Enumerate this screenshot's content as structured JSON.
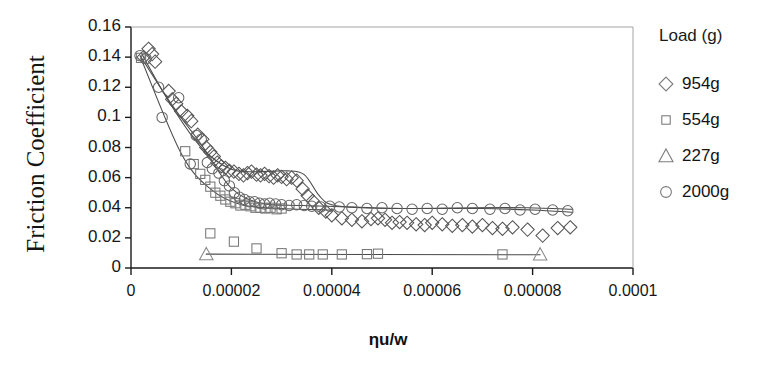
{
  "chart_data": {
    "type": "scatter",
    "title": "",
    "xlabel": "ηu/w",
    "ylabel": "Friction Coefficient",
    "xlim": [
      0,
      0.0001
    ],
    "ylim": [
      0,
      0.16
    ],
    "grid": false,
    "legend_position": "right",
    "legend_title": "Load (g)",
    "x_ticks": [
      "0",
      "0.00002",
      "0.00004",
      "0.00006",
      "0.00008",
      "0.0001"
    ],
    "x_tick_values": [
      0,
      2e-05,
      4e-05,
      6e-05,
      8e-05,
      0.0001
    ],
    "y_ticks": [
      "0",
      "0.02",
      "0.04",
      "0.06",
      "0.08",
      "0.1",
      "0.12",
      "0.14",
      "0.16"
    ],
    "y_tick_values": [
      0,
      0.02,
      0.04,
      0.06,
      0.08,
      0.1,
      0.12,
      0.14,
      0.16
    ],
    "series": [
      {
        "name": "954g",
        "marker": "diamond",
        "color": "#555555",
        "points": [
          [
            2.5e-06,
            0.14
          ],
          [
            3.5e-06,
            0.1455
          ],
          [
            4.2e-06,
            0.142
          ],
          [
            4.8e-06,
            0.137
          ],
          [
            7.5e-06,
            0.1175
          ],
          [
            8.2e-06,
            0.112
          ],
          [
            9e-06,
            0.109
          ],
          [
            1e-05,
            0.104
          ],
          [
            1.12e-05,
            0.101
          ],
          [
            1.2e-05,
            0.0975
          ],
          [
            1.33e-05,
            0.0885
          ],
          [
            1.42e-05,
            0.0855
          ],
          [
            1.5e-05,
            0.08
          ],
          [
            1.58e-05,
            0.077
          ],
          [
            1.65e-05,
            0.074
          ],
          [
            1.72e-05,
            0.07
          ],
          [
            1.8e-05,
            0.0675
          ],
          [
            1.88e-05,
            0.0665
          ],
          [
            1.96e-05,
            0.0645
          ],
          [
            2.05e-05,
            0.064
          ],
          [
            2.15e-05,
            0.0625
          ],
          [
            2.24e-05,
            0.0615
          ],
          [
            2.32e-05,
            0.063
          ],
          [
            2.4e-05,
            0.064
          ],
          [
            2.5e-05,
            0.062
          ],
          [
            2.58e-05,
            0.0615
          ],
          [
            2.66e-05,
            0.0625
          ],
          [
            2.75e-05,
            0.061
          ],
          [
            2.84e-05,
            0.06
          ],
          [
            2.92e-05,
            0.0615
          ],
          [
            3e-05,
            0.0605
          ],
          [
            3.1e-05,
            0.059
          ],
          [
            3.2e-05,
            0.06
          ],
          [
            3.3e-05,
            0.058
          ],
          [
            3.42e-05,
            0.0525
          ],
          [
            3.52e-05,
            0.048
          ],
          [
            3.62e-05,
            0.0445
          ],
          [
            3.74e-05,
            0.04
          ],
          [
            3.88e-05,
            0.0375
          ],
          [
            4e-05,
            0.035
          ],
          [
            4.2e-05,
            0.033
          ],
          [
            4.4e-05,
            0.032
          ],
          [
            4.6e-05,
            0.031
          ],
          [
            4.78e-05,
            0.0325
          ],
          [
            4.92e-05,
            0.033
          ],
          [
            5.06e-05,
            0.032
          ],
          [
            5.2e-05,
            0.03
          ],
          [
            5.35e-05,
            0.0305
          ],
          [
            5.5e-05,
            0.03
          ],
          [
            5.68e-05,
            0.029
          ],
          [
            5.85e-05,
            0.0285
          ],
          [
            6e-05,
            0.03
          ],
          [
            6.2e-05,
            0.029
          ],
          [
            6.4e-05,
            0.028
          ],
          [
            6.6e-05,
            0.0285
          ],
          [
            6.8e-05,
            0.0275
          ],
          [
            7e-05,
            0.0285
          ],
          [
            7.2e-05,
            0.0265
          ],
          [
            7.4e-05,
            0.026
          ],
          [
            7.6e-05,
            0.027
          ],
          [
            7.9e-05,
            0.0255
          ],
          [
            8.2e-05,
            0.0215
          ],
          [
            8.5e-05,
            0.0265
          ],
          [
            8.75e-05,
            0.027
          ]
        ],
        "trend": [
          [
            2e-06,
            0.143
          ],
          [
            8e-06,
            0.108
          ],
          [
            1.4e-05,
            0.08
          ],
          [
            2e-05,
            0.0655
          ],
          [
            2.6e-05,
            0.064
          ],
          [
            3.1e-05,
            0.0645
          ],
          [
            3.45e-05,
            0.062
          ],
          [
            3.75e-05,
            0.048
          ],
          [
            4e-05,
            0.042
          ],
          [
            4.6e-05,
            0.04
          ],
          [
            5.6e-05,
            0.0395
          ],
          [
            6.8e-05,
            0.04
          ],
          [
            7.9e-05,
            0.04
          ],
          [
            8.8e-05,
            0.039
          ]
        ]
      },
      {
        "name": "554g",
        "marker": "square",
        "color": "#777777",
        "points": [
          [
            2e-06,
            0.1395
          ],
          [
            1.08e-05,
            0.0775
          ],
          [
            1.25e-05,
            0.069
          ],
          [
            1.38e-05,
            0.0625
          ],
          [
            1.48e-05,
            0.0585
          ],
          [
            1.58e-05,
            0.054
          ],
          [
            1.68e-05,
            0.05
          ],
          [
            1.78e-05,
            0.048
          ],
          [
            1.88e-05,
            0.0455
          ],
          [
            1.98e-05,
            0.044
          ],
          [
            2.08e-05,
            0.043
          ],
          [
            2.18e-05,
            0.0415
          ],
          [
            2.28e-05,
            0.042
          ],
          [
            2.38e-05,
            0.041
          ],
          [
            2.48e-05,
            0.04
          ],
          [
            2.58e-05,
            0.04
          ],
          [
            2.68e-05,
            0.0395
          ],
          [
            2.78e-05,
            0.04
          ],
          [
            2.9e-05,
            0.039
          ],
          [
            3e-05,
            0.0395
          ],
          [
            1.58e-05,
            0.023
          ],
          [
            2.05e-05,
            0.0175
          ],
          [
            2.5e-05,
            0.013
          ],
          [
            3e-05,
            0.0098
          ],
          [
            3.3e-05,
            0.009
          ],
          [
            3.55e-05,
            0.009
          ],
          [
            3.82e-05,
            0.009
          ],
          [
            4.2e-05,
            0.009
          ],
          [
            4.7e-05,
            0.0092
          ],
          [
            4.92e-05,
            0.0095
          ],
          [
            7.4e-05,
            0.009
          ]
        ],
        "trend": [
          [
            2e-06,
            0.139
          ],
          [
            1e-05,
            0.076
          ],
          [
            1.6e-05,
            0.052
          ],
          [
            2.2e-05,
            0.042
          ],
          [
            3e-05,
            0.0395
          ],
          [
            4e-05,
            0.0385
          ]
        ]
      },
      {
        "name": "227g",
        "marker": "triangle",
        "color": "#888888",
        "points": [
          [
            1.5e-05,
            0.0092
          ],
          [
            8.15e-05,
            0.009
          ]
        ],
        "trend": [
          [
            1.5e-05,
            0.0092
          ],
          [
            8.15e-05,
            0.0088
          ]
        ]
      },
      {
        "name": "2000g",
        "marker": "circle",
        "color": "#666666",
        "points": [
          [
            1.8e-06,
            0.141
          ],
          [
            3e-06,
            0.139
          ],
          [
            5.5e-06,
            0.12
          ],
          [
            6.2e-06,
            0.1
          ],
          [
            9.5e-06,
            0.113
          ],
          [
            1.3e-05,
            0.088
          ],
          [
            1.4e-05,
            0.0855
          ],
          [
            1.18e-05,
            0.069
          ],
          [
            1.52e-05,
            0.07
          ],
          [
            1.62e-05,
            0.066
          ],
          [
            1.75e-05,
            0.063
          ],
          [
            1.86e-05,
            0.058
          ],
          [
            1.96e-05,
            0.0545
          ],
          [
            2.06e-05,
            0.05
          ],
          [
            2.16e-05,
            0.047
          ],
          [
            2.26e-05,
            0.0455
          ],
          [
            2.36e-05,
            0.044
          ],
          [
            2.46e-05,
            0.044
          ],
          [
            2.56e-05,
            0.043
          ],
          [
            2.66e-05,
            0.0425
          ],
          [
            2.76e-05,
            0.043
          ],
          [
            2.88e-05,
            0.0425
          ],
          [
            3e-05,
            0.042
          ],
          [
            3.15e-05,
            0.0415
          ],
          [
            3.3e-05,
            0.042
          ],
          [
            3.45e-05,
            0.0415
          ],
          [
            3.6e-05,
            0.041
          ],
          [
            3.78e-05,
            0.0405
          ],
          [
            3.96e-05,
            0.041
          ],
          [
            4.15e-05,
            0.0405
          ],
          [
            4.4e-05,
            0.04
          ],
          [
            4.7e-05,
            0.0395
          ],
          [
            5e-05,
            0.04
          ],
          [
            5.3e-05,
            0.0395
          ],
          [
            5.6e-05,
            0.039
          ],
          [
            5.9e-05,
            0.0395
          ],
          [
            6.2e-05,
            0.039
          ],
          [
            6.5e-05,
            0.04
          ],
          [
            6.8e-05,
            0.0395
          ],
          [
            7.15e-05,
            0.039
          ],
          [
            7.45e-05,
            0.0395
          ],
          [
            7.75e-05,
            0.0385
          ],
          [
            8.05e-05,
            0.039
          ],
          [
            8.4e-05,
            0.0385
          ],
          [
            8.7e-05,
            0.038
          ]
        ],
        "trend": [
          [
            1.8e-06,
            0.141
          ],
          [
            8e-06,
            0.109
          ],
          [
            1.4e-05,
            0.082
          ],
          [
            2e-05,
            0.053
          ],
          [
            2.6e-05,
            0.043
          ],
          [
            3.4e-05,
            0.0415
          ],
          [
            4.4e-05,
            0.0405
          ],
          [
            5.6e-05,
            0.0395
          ],
          [
            7e-05,
            0.0395
          ],
          [
            8e-05,
            0.0385
          ],
          [
            8.8e-05,
            0.037
          ]
        ]
      }
    ]
  },
  "legend": {
    "title": "Load (g)",
    "items": [
      {
        "label": "954g",
        "marker": "diamond"
      },
      {
        "label": "554g",
        "marker": "square"
      },
      {
        "label": "227g",
        "marker": "triangle"
      },
      {
        "label": "2000g",
        "marker": "circle"
      }
    ]
  },
  "colors": {
    "axis": "#1a1a1a",
    "marker": "#5a5a5a",
    "trend": "#4a4a4a",
    "text": "#141414",
    "background": "#ffffff"
  }
}
